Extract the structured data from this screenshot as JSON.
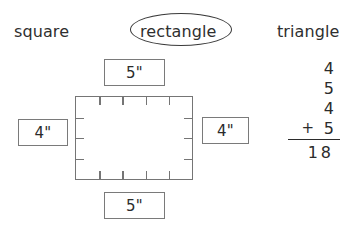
{
  "header": {
    "options": [
      {
        "label": "square",
        "selected": false
      },
      {
        "label": "rectangle",
        "selected": true
      },
      {
        "label": "triangle",
        "selected": false
      }
    ]
  },
  "figure": {
    "shape_name": "square",
    "top_ticks": 4,
    "bottom_ticks": 4,
    "left_ticks": 3,
    "right_ticks": 3,
    "measurements": {
      "top": "5\"",
      "bottom": "5\"",
      "left": "4\"",
      "right": "4\""
    }
  },
  "addition": {
    "addends": [
      "4",
      "5",
      "4",
      "5"
    ],
    "plus_sign": "+",
    "sum_tens": "1",
    "sum_ones": "8",
    "sum": "18"
  },
  "colors": {
    "text": "#2b2b2b",
    "border": "#757575",
    "ellipse": "#3a3a3a",
    "background": "#ffffff"
  }
}
